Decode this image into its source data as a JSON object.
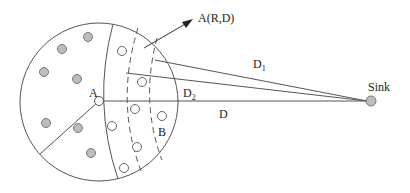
{
  "diagram": {
    "labels": {
      "arrow_label": "A(R,D)",
      "node_a": "A",
      "region_b": "B",
      "d1": "D",
      "d1_sub": "1",
      "d2": "D",
      "d2_sub": "2",
      "d": "D",
      "sink": "Sink"
    },
    "colors": {
      "line": "#555555",
      "filled_node": "#bdbdbd",
      "filled_node_stroke": "#777777",
      "empty_node": "#ffffff"
    },
    "filled_nodes": [
      [
        88,
        37
      ],
      [
        62,
        49
      ],
      [
        44,
        72
      ],
      [
        77,
        79
      ],
      [
        46,
        123
      ],
      [
        78,
        128
      ],
      [
        91,
        153
      ]
    ],
    "empty_nodes": [
      [
        122,
        51
      ],
      [
        142,
        82
      ],
      [
        135,
        109
      ],
      [
        112,
        126
      ],
      [
        162,
        116
      ],
      [
        137,
        147
      ],
      [
        124,
        168
      ]
    ]
  }
}
